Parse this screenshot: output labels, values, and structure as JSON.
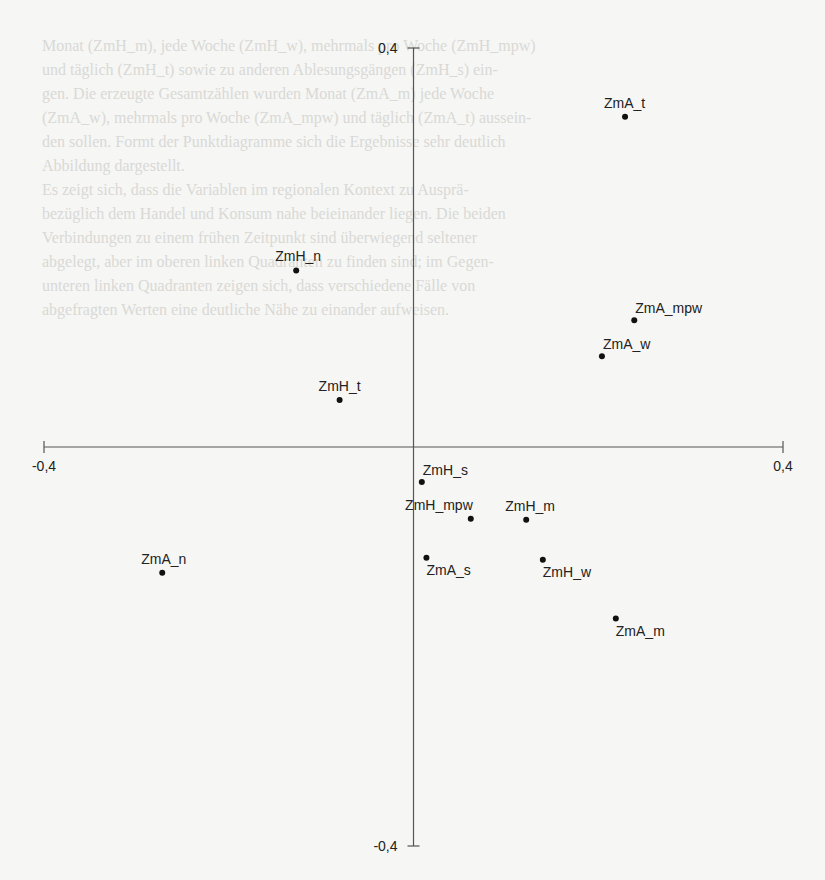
{
  "background": {
    "bleed_through_lines": [
      "Monat (ZmH_m), jede Woche (ZmH_w), mehrmals pro Woche (ZmH_mpw)",
      "und täglich (ZmH_t) sowie zu anderen Ablesungsgängen (ZmH_s) ein-",
      "gen. Die erzeugte Gesamtzählen wurden Monat (ZmA_m) jede Woche",
      "(ZmA_w), mehrmals pro Woche (ZmA_mpw) und täglich (ZmA_t) aussein-",
      "den sollen. Formt der Punktdiagramme sich die Ergebnisse sehr deutlich",
      "Abbildung dargestellt.",
      "    Es zeigt sich, dass die Variablen im regionalen Kontext zu Ausprä-",
      "bezüglich dem Handel und Konsum nahe beieinander liegen. Die beiden",
      "Verbindungen zu einem frühen Zeitpunkt sind überwiegend seltener",
      "abgelegt, aber im oberen linken Quadranten zu finden sind; im Gegen-",
      "unteren linken Quadranten zeigen sich, dass verschiedene Fälle von",
      "abgefragten Werten eine deutliche Nähe zu einander aufweisen."
    ]
  },
  "chart_data": {
    "type": "scatter",
    "title": "",
    "xlabel": "",
    "ylabel": "",
    "xlim": [
      -0.4,
      0.4
    ],
    "ylim": [
      -0.4,
      0.4
    ],
    "grid": false,
    "legend": "none",
    "axes_style": "crosshair through origin",
    "x_ticks": [
      {
        "value": -0.4,
        "label": "-0,4"
      },
      {
        "value": 0.4,
        "label": "0,4"
      }
    ],
    "y_ticks": [
      {
        "value": 0.4,
        "label": "0,4"
      },
      {
        "value": -0.4,
        "label": "-0,4"
      }
    ],
    "points": [
      {
        "label": "ZmA_t",
        "x": 0.229,
        "y": 0.331,
        "label_pos": "above"
      },
      {
        "label": "ZmH_n",
        "x": -0.127,
        "y": 0.177,
        "label_pos": "above"
      },
      {
        "label": "ZmA_mpw",
        "x": 0.239,
        "y": 0.127,
        "label_pos": "above-right"
      },
      {
        "label": "ZmA_w",
        "x": 0.204,
        "y": 0.091,
        "label_pos": "above-right"
      },
      {
        "label": "ZmH_t",
        "x": -0.08,
        "y": 0.047,
        "label_pos": "above"
      },
      {
        "label": "ZmH_s",
        "x": 0.009,
        "y": -0.035,
        "label_pos": "above-right"
      },
      {
        "label": "ZmH_mpw",
        "x": 0.062,
        "y": -0.072,
        "label_pos": "above-left"
      },
      {
        "label": "ZmH_m",
        "x": 0.122,
        "y": -0.073,
        "label_pos": "above"
      },
      {
        "label": "ZmA_s",
        "x": 0.014,
        "y": -0.111,
        "label_pos": "below-right"
      },
      {
        "label": "ZmH_w",
        "x": 0.14,
        "y": -0.113,
        "label_pos": "below-right"
      },
      {
        "label": "ZmA_n",
        "x": -0.272,
        "y": -0.126,
        "label_pos": "above"
      },
      {
        "label": "ZmA_m",
        "x": 0.219,
        "y": -0.172,
        "label_pos": "below-right"
      }
    ]
  },
  "colors": {
    "axis": "#555555",
    "point": "#111111",
    "text": "#222222",
    "paper": "#f6f6f4"
  }
}
